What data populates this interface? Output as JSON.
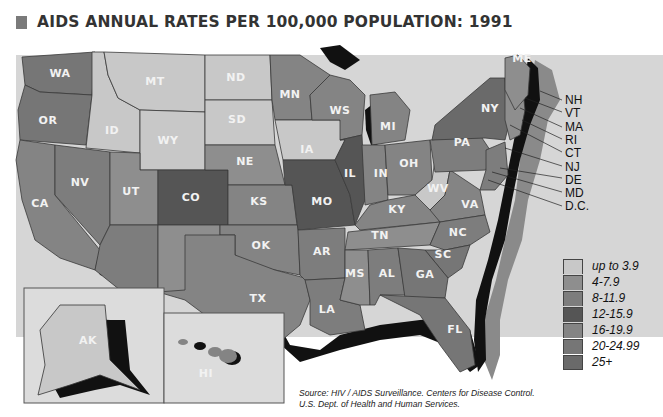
{
  "title": "AIDS ANNUAL RATES PER 100,000 POPULATION: 1991",
  "colors": {
    "background": "#ffffff",
    "map_background": "#d6d6d6",
    "title_swatch": "#7a7a7a",
    "shadow_black": "#111111",
    "shadow_gray": "#8a8a8a"
  },
  "legend": {
    "items": [
      {
        "label": "up to 3.9",
        "color": "#c8c8c8"
      },
      {
        "label": "4-7.9",
        "color": "#8e8e8e"
      },
      {
        "label": "8-11.9",
        "color": "#7d7d7d"
      },
      {
        "label": "12-15.9",
        "color": "#555555"
      },
      {
        "label": "16-19.9",
        "color": "#848484"
      },
      {
        "label": "20-24.99",
        "color": "#767676"
      },
      {
        "label": "25+",
        "color": "#6a6a6a"
      }
    ]
  },
  "states": {
    "WA": "WA",
    "OR": "OR",
    "CA": "CA",
    "NV": "NV",
    "ID": "ID",
    "MT": "MT",
    "WY": "WY",
    "UT": "UT",
    "AZ": "AZ",
    "NM": "NM",
    "CO": "CO",
    "ND": "ND",
    "SD": "SD",
    "NE": "NE",
    "KS": "KS",
    "OK": "OK",
    "TX": "TX",
    "MN": "MN",
    "IA": "IA",
    "MO": "MO",
    "AR": "AR",
    "LA": "LA",
    "WS": "WS",
    "IL": "IL",
    "MI": "MI",
    "IN": "IN",
    "OH": "OH",
    "KY": "KY",
    "TN": "TN",
    "MS": "MS",
    "AL": "AL",
    "GA": "GA",
    "FL": "FL",
    "SC": "SC",
    "NC": "NC",
    "VA": "VA",
    "WV": "WV",
    "PA": "PA",
    "NY": "NY",
    "ME": "ME",
    "AK": "AK",
    "HI": "HI"
  },
  "northeast_callouts": [
    "NH",
    "VT",
    "MA",
    "RI",
    "CT",
    "NJ",
    "DE",
    "MD",
    "D.C."
  ],
  "source": {
    "line1": "Source: HIV / AIDS Surveillance. Centers for Disease Control.",
    "line2": "U.S. Dept. of Health and Human Services."
  }
}
